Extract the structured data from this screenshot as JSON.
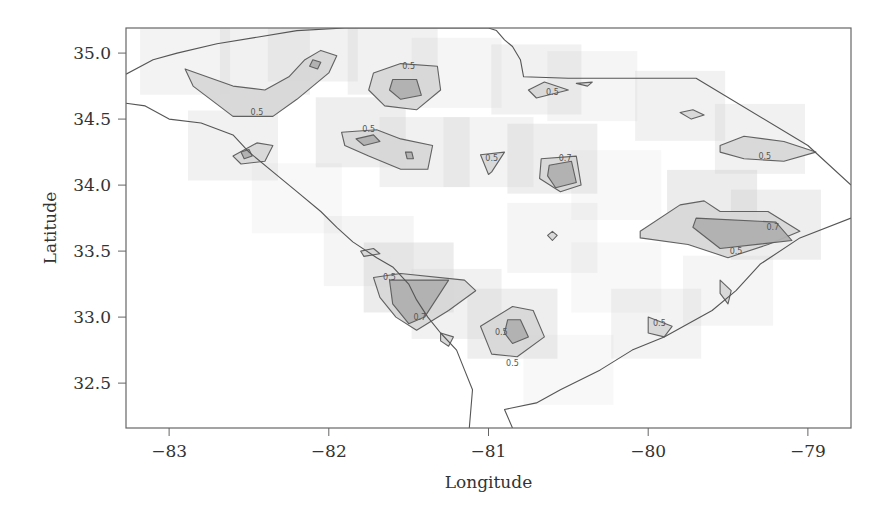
{
  "chart_data": {
    "type": "heatmap",
    "subtype": "contour-map",
    "title": "",
    "xlabel": "Longitude",
    "ylabel": "Latitude",
    "xlim": [
      -83.27,
      -78.73
    ],
    "ylim": [
      32.16,
      35.19
    ],
    "xticks": [
      -83,
      -82,
      -81,
      -80,
      -79
    ],
    "xtick_labels": [
      "−83",
      "−82",
      "−81",
      "−80",
      "−79"
    ],
    "yticks": [
      32.5,
      33.0,
      33.5,
      34.0,
      34.5,
      35.0
    ],
    "ytick_labels": [
      "32.5",
      "33.0",
      "33.5",
      "34.0",
      "34.5",
      "35.0"
    ],
    "grid": false,
    "legend": "none",
    "contour_levels": [
      0.5,
      0.7
    ],
    "colors": {
      "background": "#ffffff",
      "shade_light": "#e6e6e6",
      "shade_mid": "#d2d2d2",
      "shade_dark": "#b4b4b4",
      "line": "#555555",
      "frame": "#666666"
    },
    "boundary": [
      [
        -83.27,
        34.84
      ],
      [
        -83.1,
        34.95
      ],
      [
        -82.95,
        35.0
      ],
      [
        -82.7,
        35.07
      ],
      [
        -82.45,
        35.12
      ],
      [
        -82.2,
        35.17
      ],
      [
        -81.9,
        35.19
      ],
      [
        -81.0,
        35.19
      ],
      [
        -80.95,
        35.17
      ],
      [
        -80.9,
        35.1
      ],
      [
        -80.85,
        35.05
      ],
      [
        -80.8,
        34.95
      ],
      [
        -80.78,
        34.82
      ],
      [
        -80.5,
        34.81
      ],
      [
        -79.7,
        34.81
      ],
      [
        -79.0,
        34.3
      ],
      [
        -78.73,
        34.0
      ]
    ],
    "boundary_west": [
      [
        -83.27,
        34.62
      ],
      [
        -83.15,
        34.6
      ],
      [
        -83.0,
        34.5
      ],
      [
        -82.8,
        34.47
      ],
      [
        -82.6,
        34.38
      ],
      [
        -82.5,
        34.25
      ],
      [
        -82.35,
        34.1
      ],
      [
        -82.2,
        33.95
      ],
      [
        -82.05,
        33.8
      ],
      [
        -81.95,
        33.68
      ],
      [
        -81.85,
        33.57
      ],
      [
        -81.7,
        33.45
      ],
      [
        -81.6,
        33.38
      ],
      [
        -81.5,
        33.25
      ],
      [
        -81.45,
        33.13
      ],
      [
        -81.38,
        33.0
      ],
      [
        -81.3,
        32.88
      ],
      [
        -81.2,
        32.75
      ],
      [
        -81.15,
        32.6
      ],
      [
        -81.1,
        32.45
      ],
      [
        -81.12,
        32.16
      ]
    ],
    "coast": [
      [
        -80.85,
        32.16
      ],
      [
        -80.9,
        32.3
      ],
      [
        -80.7,
        32.35
      ],
      [
        -80.55,
        32.45
      ],
      [
        -80.3,
        32.6
      ],
      [
        -80.1,
        32.75
      ],
      [
        -79.9,
        32.85
      ],
      [
        -79.6,
        33.05
      ],
      [
        -79.45,
        33.2
      ],
      [
        -79.3,
        33.4
      ],
      [
        -79.05,
        33.6
      ],
      [
        -78.73,
        33.75
      ]
    ],
    "regions": [
      {
        "name": "upstate",
        "level": 0.5,
        "label": "0.5",
        "label_at": [
          -82.45,
          34.55
        ],
        "poly": [
          [
            -82.9,
            34.88
          ],
          [
            -82.6,
            34.75
          ],
          [
            -82.4,
            34.72
          ],
          [
            -82.25,
            34.82
          ],
          [
            -82.15,
            34.95
          ],
          [
            -82.05,
            35.02
          ],
          [
            -81.95,
            34.98
          ],
          [
            -82.0,
            34.85
          ],
          [
            -82.2,
            34.65
          ],
          [
            -82.35,
            34.52
          ],
          [
            -82.6,
            34.52
          ],
          [
            -82.85,
            34.75
          ]
        ]
      },
      {
        "name": "spartanburg-center",
        "level": 0.7,
        "poly": [
          [
            -82.1,
            34.95
          ],
          [
            -82.05,
            34.93
          ],
          [
            -82.07,
            34.88
          ],
          [
            -82.12,
            34.9
          ]
        ]
      },
      {
        "name": "anderson",
        "level": 0.5,
        "poly": [
          [
            -82.6,
            34.22
          ],
          [
            -82.45,
            34.32
          ],
          [
            -82.35,
            34.3
          ],
          [
            -82.4,
            34.18
          ],
          [
            -82.55,
            34.16
          ]
        ]
      },
      {
        "name": "anderson-core",
        "level": 0.7,
        "poly": [
          [
            -82.55,
            34.25
          ],
          [
            -82.5,
            34.27
          ],
          [
            -82.48,
            34.22
          ],
          [
            -82.53,
            34.2
          ]
        ]
      },
      {
        "name": "york",
        "level": 0.5,
        "label": "0.5",
        "label_at": [
          -81.5,
          34.9
        ],
        "poly": [
          [
            -81.72,
            34.85
          ],
          [
            -81.55,
            34.92
          ],
          [
            -81.32,
            34.9
          ],
          [
            -81.3,
            34.72
          ],
          [
            -81.45,
            34.57
          ],
          [
            -81.65,
            34.6
          ],
          [
            -81.75,
            34.72
          ]
        ]
      },
      {
        "name": "york-core",
        "level": 0.7,
        "poly": [
          [
            -81.6,
            34.8
          ],
          [
            -81.45,
            34.8
          ],
          [
            -81.42,
            34.68
          ],
          [
            -81.55,
            34.65
          ],
          [
            -81.62,
            34.72
          ]
        ]
      },
      {
        "name": "newberry",
        "level": 0.5,
        "label": "0.5",
        "label_at": [
          -81.75,
          34.42
        ],
        "poly": [
          [
            -81.92,
            34.4
          ],
          [
            -81.7,
            34.42
          ],
          [
            -81.55,
            34.35
          ],
          [
            -81.35,
            34.3
          ],
          [
            -81.38,
            34.12
          ],
          [
            -81.55,
            34.12
          ],
          [
            -81.75,
            34.22
          ],
          [
            -81.9,
            34.3
          ]
        ]
      },
      {
        "name": "newberry-core",
        "level": 0.7,
        "poly": [
          [
            -81.83,
            34.35
          ],
          [
            -81.72,
            34.38
          ],
          [
            -81.68,
            34.33
          ],
          [
            -81.78,
            34.3
          ]
        ]
      },
      {
        "name": "saluda-spot",
        "level": 0.7,
        "poly": [
          [
            -81.52,
            34.25
          ],
          [
            -81.48,
            34.25
          ],
          [
            -81.47,
            34.2
          ],
          [
            -81.51,
            34.2
          ]
        ]
      },
      {
        "name": "columbia",
        "level": 0.5,
        "label": "0.5",
        "label_at": [
          -80.98,
          34.2
        ],
        "poly": [
          [
            -81.05,
            34.23
          ],
          [
            -80.9,
            34.25
          ],
          [
            -80.98,
            34.1
          ],
          [
            -81.0,
            34.08
          ]
        ]
      },
      {
        "name": "kershaw",
        "level": 0.5,
        "label": "0.7",
        "label_at": [
          -80.52,
          34.2
        ],
        "poly": [
          [
            -80.67,
            34.2
          ],
          [
            -80.45,
            34.22
          ],
          [
            -80.42,
            34.0
          ],
          [
            -80.55,
            33.95
          ],
          [
            -80.68,
            34.05
          ]
        ]
      },
      {
        "name": "kershaw-core",
        "level": 0.7,
        "poly": [
          [
            -80.62,
            34.15
          ],
          [
            -80.48,
            34.18
          ],
          [
            -80.45,
            34.02
          ],
          [
            -80.58,
            33.98
          ],
          [
            -80.63,
            34.07
          ]
        ]
      },
      {
        "name": "chesterfield",
        "level": 0.5,
        "label": "0.5",
        "label_at": [
          -80.6,
          34.7
        ],
        "poly": [
          [
            -80.75,
            34.72
          ],
          [
            -80.65,
            34.78
          ],
          [
            -80.5,
            34.72
          ],
          [
            -80.7,
            34.66
          ]
        ]
      },
      {
        "name": "marlboro-spot",
        "level": 0.5,
        "poly": [
          [
            -80.45,
            34.77
          ],
          [
            -80.35,
            34.78
          ],
          [
            -80.38,
            34.75
          ]
        ]
      },
      {
        "name": "dillon-spot",
        "level": 0.5,
        "poly": [
          [
            -79.8,
            34.55
          ],
          [
            -79.72,
            34.57
          ],
          [
            -79.65,
            34.53
          ],
          [
            -79.73,
            34.5
          ]
        ]
      },
      {
        "name": "florence-north",
        "level": 0.5,
        "label": "0.5",
        "label_at": [
          -79.27,
          34.22
        ],
        "poly": [
          [
            -79.55,
            34.3
          ],
          [
            -79.4,
            34.37
          ],
          [
            -79.15,
            34.33
          ],
          [
            -78.95,
            34.25
          ],
          [
            -79.15,
            34.18
          ],
          [
            -79.4,
            34.2
          ],
          [
            -79.55,
            34.25
          ]
        ]
      },
      {
        "name": "florence-south",
        "level": 0.5,
        "label": "0.5",
        "label_at": [
          -79.45,
          33.5
        ],
        "poly": [
          [
            -80.05,
            33.65
          ],
          [
            -79.8,
            33.85
          ],
          [
            -79.65,
            33.88
          ],
          [
            -79.55,
            33.8
          ],
          [
            -79.25,
            33.8
          ],
          [
            -79.05,
            33.65
          ],
          [
            -79.25,
            33.55
          ],
          [
            -79.5,
            33.45
          ],
          [
            -79.75,
            33.55
          ],
          [
            -80.05,
            33.6
          ]
        ]
      },
      {
        "name": "florence-core",
        "level": 0.7,
        "label": "0.7",
        "label_at": [
          -79.22,
          33.68
        ],
        "poly": [
          [
            -79.7,
            33.75
          ],
          [
            -79.2,
            33.72
          ],
          [
            -79.1,
            33.58
          ],
          [
            -79.55,
            33.52
          ],
          [
            -79.72,
            33.68
          ]
        ]
      },
      {
        "name": "williamsburg-spot",
        "level": 0.5,
        "poly": [
          [
            -79.55,
            33.28
          ],
          [
            -79.48,
            33.2
          ],
          [
            -79.5,
            33.1
          ],
          [
            -79.55,
            33.18
          ]
        ]
      },
      {
        "name": "calhoun-spot",
        "level": 0.5,
        "poly": [
          [
            -80.6,
            33.65
          ],
          [
            -80.57,
            33.62
          ],
          [
            -80.6,
            33.58
          ],
          [
            -80.63,
            33.62
          ]
        ]
      },
      {
        "name": "edgefield-spot",
        "level": 0.5,
        "poly": [
          [
            -81.8,
            33.5
          ],
          [
            -81.72,
            33.52
          ],
          [
            -81.68,
            33.48
          ],
          [
            -81.78,
            33.46
          ]
        ]
      },
      {
        "name": "aiken",
        "level": 0.5,
        "label": "0.5",
        "label_at": [
          -81.62,
          33.3
        ],
        "poly": [
          [
            -81.72,
            33.3
          ],
          [
            -81.55,
            33.33
          ],
          [
            -81.15,
            33.28
          ],
          [
            -81.08,
            33.2
          ],
          [
            -81.25,
            33.05
          ],
          [
            -81.45,
            32.9
          ],
          [
            -81.58,
            33.0
          ],
          [
            -81.68,
            33.15
          ]
        ]
      },
      {
        "name": "aiken-core",
        "level": 0.7,
        "label": "0.7",
        "label_at": [
          -81.43,
          33.0
        ],
        "poly": [
          [
            -81.62,
            33.28
          ],
          [
            -81.25,
            33.28
          ],
          [
            -81.4,
            33.0
          ],
          [
            -81.5,
            32.95
          ],
          [
            -81.6,
            33.1
          ]
        ]
      },
      {
        "name": "allendale-spot",
        "level": 0.5,
        "poly": [
          [
            -81.3,
            32.88
          ],
          [
            -81.22,
            32.85
          ],
          [
            -81.25,
            32.78
          ],
          [
            -81.3,
            32.82
          ]
        ]
      },
      {
        "name": "colleton",
        "level": 0.5,
        "label": "0.5",
        "label_at": [
          -80.85,
          32.65
        ],
        "poly": [
          [
            -81.05,
            32.93
          ],
          [
            -80.85,
            33.08
          ],
          [
            -80.72,
            33.05
          ],
          [
            -80.65,
            32.85
          ],
          [
            -80.82,
            32.7
          ],
          [
            -80.98,
            32.72
          ]
        ]
      },
      {
        "name": "colleton-core",
        "level": 0.7,
        "label": "0.5",
        "label_at": [
          -80.92,
          32.88
        ],
        "poly": [
          [
            -80.88,
            32.98
          ],
          [
            -80.8,
            32.98
          ],
          [
            -80.75,
            32.85
          ],
          [
            -80.85,
            32.8
          ],
          [
            -80.9,
            32.88
          ]
        ]
      },
      {
        "name": "dorchester-spot",
        "level": 0.5,
        "label": "0.5",
        "label_at": [
          -79.93,
          32.95
        ],
        "poly": [
          [
            -80.0,
            33.0
          ],
          [
            -79.85,
            32.93
          ],
          [
            -79.9,
            32.85
          ],
          [
            -80.0,
            32.88
          ]
        ]
      }
    ],
    "shading_blocks": [
      [
        -82.9,
        34.95,
        0.25
      ],
      [
        -82.4,
        34.95,
        0.3
      ],
      [
        -82.1,
        35.05,
        0.3
      ],
      [
        -81.6,
        34.95,
        0.3
      ],
      [
        -81.2,
        34.85,
        0.2
      ],
      [
        -80.7,
        34.8,
        0.3
      ],
      [
        -80.35,
        34.75,
        0.2
      ],
      [
        -79.8,
        34.6,
        0.3
      ],
      [
        -79.3,
        34.35,
        0.3
      ],
      [
        -82.6,
        34.3,
        0.3
      ],
      [
        -81.8,
        34.4,
        0.35
      ],
      [
        -81.4,
        34.25,
        0.3
      ],
      [
        -81.0,
        34.25,
        0.25
      ],
      [
        -80.6,
        34.2,
        0.35
      ],
      [
        -80.2,
        34.0,
        0.15
      ],
      [
        -79.6,
        33.85,
        0.4
      ],
      [
        -79.2,
        33.7,
        0.35
      ],
      [
        -82.2,
        33.9,
        0.15
      ],
      [
        -81.5,
        33.3,
        0.4
      ],
      [
        -81.2,
        33.1,
        0.3
      ],
      [
        -80.85,
        32.95,
        0.35
      ],
      [
        -80.6,
        33.6,
        0.2
      ],
      [
        -79.95,
        32.95,
        0.25
      ],
      [
        -79.5,
        33.2,
        0.2
      ],
      [
        -81.75,
        33.5,
        0.2
      ],
      [
        -80.2,
        33.3,
        0.15
      ],
      [
        -80.5,
        32.6,
        0.15
      ]
    ]
  }
}
